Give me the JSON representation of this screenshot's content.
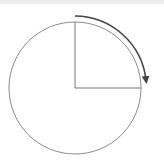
{
  "diagram": {
    "shape": "circle",
    "center": [
      75,
      88
    ],
    "radius": 66,
    "sector": {
      "start_angle_deg": 90,
      "end_angle_deg": 0,
      "fraction": "1/4"
    },
    "arrow": {
      "direction": "clockwise",
      "from": "top",
      "to": "right"
    },
    "colors": {
      "circle_stroke": "#8a8a8a",
      "radius_stroke": "#777777",
      "arrow_stroke": "#444444",
      "top_band": "#ececec"
    }
  }
}
